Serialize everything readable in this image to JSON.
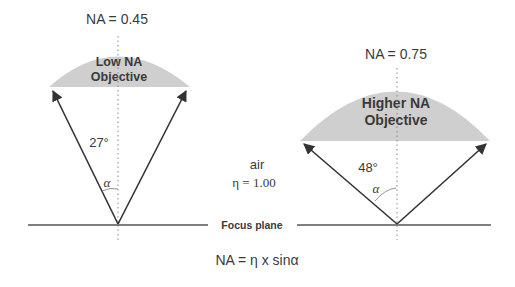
{
  "diagram": {
    "left": {
      "na_label": "NA = 0.45",
      "lens_line1": "Low NA",
      "lens_line2": "Objective",
      "angle_label": "27°",
      "alpha_label": "α"
    },
    "right": {
      "na_label": "NA =  0.75",
      "lens_line1": "Higher NA",
      "lens_line2": "Objective",
      "angle_label": "48°",
      "alpha_label": "α"
    },
    "medium": {
      "name": "air",
      "index": "η = 1.00"
    },
    "focus_plane_label": "Focus plane",
    "formula": "NA = η x sinα",
    "colors": {
      "lens_fill": "#cfcfcf",
      "line": "#3a3a3a",
      "text": "#3a3a3a",
      "dotted": "#8a8a8a"
    }
  }
}
